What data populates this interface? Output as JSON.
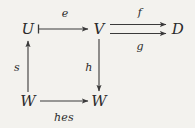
{
  "diagram": {
    "type": "commutative-diagram",
    "background_color": "#f3f2ee",
    "ink_color": "#2a2a2a",
    "nodes": [
      {
        "id": "U",
        "label": "U",
        "x": 28,
        "y": 29
      },
      {
        "id": "V",
        "label": "V",
        "x": 99,
        "y": 29
      },
      {
        "id": "D",
        "label": "D",
        "x": 178,
        "y": 29
      },
      {
        "id": "W1",
        "label": "W",
        "x": 28,
        "y": 101
      },
      {
        "id": "W2",
        "label": "W",
        "x": 99,
        "y": 101
      }
    ],
    "edges": [
      {
        "id": "e",
        "label": "e",
        "from": "U",
        "to": "V",
        "label_x": 65,
        "label_y": 13,
        "style": "tailed-right"
      },
      {
        "id": "f",
        "label": "f",
        "from": "V",
        "to": "D",
        "label_x": 140,
        "label_y": 12,
        "style": "right"
      },
      {
        "id": "g",
        "label": "g",
        "from": "V",
        "to": "D",
        "label_x": 140,
        "label_y": 46,
        "style": "right"
      },
      {
        "id": "s",
        "label": "s",
        "from": "W1",
        "to": "U",
        "label_x": 17,
        "label_y": 67,
        "style": "up"
      },
      {
        "id": "h",
        "label": "h",
        "from": "V",
        "to": "W2",
        "label_x": 89,
        "label_y": 67,
        "style": "down"
      },
      {
        "id": "hes",
        "label": "hes",
        "from": "W1",
        "to": "W2",
        "label_x": 64,
        "label_y": 117,
        "style": "right"
      }
    ]
  }
}
